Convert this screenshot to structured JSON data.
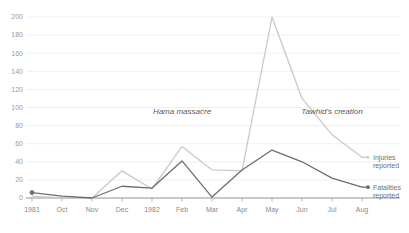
{
  "chart_data": {
    "type": "line",
    "title": "",
    "subtitle": "",
    "xlabel": "",
    "ylabel": "",
    "ylim": [
      0,
      200
    ],
    "ytick_step": 20,
    "grid": true,
    "legend_position": "right-inline",
    "categories": [
      "1981",
      "Oct",
      "Nov",
      "Dec",
      "1982",
      "Feb",
      "Mar",
      "Apr",
      "May",
      "Jun",
      "Jul",
      "Aug"
    ],
    "yticks": [
      "0",
      "20",
      "40",
      "60",
      "80",
      "100",
      "120",
      "140",
      "160",
      "180",
      "200"
    ],
    "series": [
      {
        "name": "Injuries reported",
        "color": "#c9c9c9",
        "values": [
          2,
          0,
          0,
          30,
          10,
          57,
          31,
          30,
          200,
          110,
          70,
          45
        ]
      },
      {
        "name": "Fatalities reported",
        "color": "#6e6e6e",
        "values": [
          6,
          2,
          0,
          13,
          11,
          41,
          1,
          31,
          53,
          40,
          22,
          12
        ]
      }
    ],
    "annotations": [
      {
        "text": "Hama massacre",
        "x_category": "Feb",
        "y_value": 93
      },
      {
        "text": "Tawhid's creation",
        "x_category": "Jul",
        "y_value": 93
      }
    ],
    "legend": [
      {
        "label_line1": "Injuries",
        "label_line2": "reported",
        "color": "#c9c9c9"
      },
      {
        "label_line1": "Fatalities",
        "label_line2": "reported",
        "color": "#6e6e6e"
      }
    ],
    "colors": {
      "injuries": "#c9c9c9",
      "fatalities": "#6e6e6e",
      "grid": "#e9e9e9",
      "axis": "#777777",
      "tick_text": "#9a9a9a",
      "annotation_text": "#585858",
      "background": "#ffffff"
    }
  }
}
